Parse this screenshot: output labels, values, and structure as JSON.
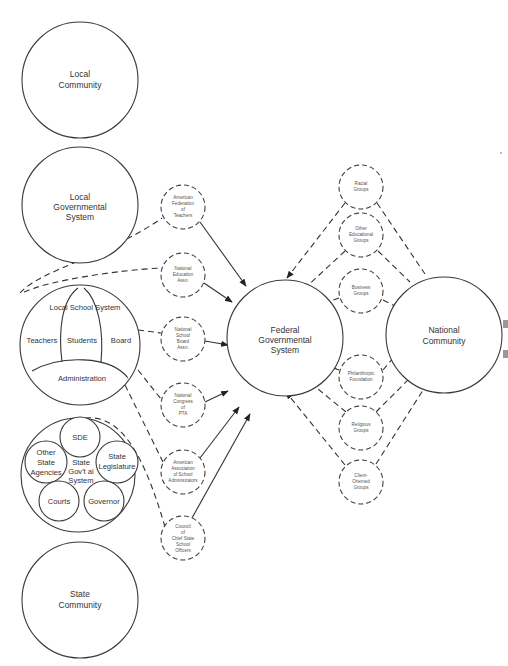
{
  "diagram": {
    "type": "system-relationship-diagram",
    "left_column": {
      "local_community": {
        "lines": [
          "Local",
          "Community"
        ]
      },
      "local_governmental_system": {
        "lines": [
          "Local",
          "Governmental",
          "System"
        ]
      },
      "local_school_system": {
        "title": "Local School System",
        "parts": [
          "Teachers",
          "Students",
          "Board"
        ],
        "bottom": "Administration"
      },
      "state_governmental_system": {
        "center_lines": [
          "State",
          "Gov't al",
          "System"
        ],
        "sde": "SDE",
        "other_state_agencies": [
          "Other",
          "State",
          "Agencies"
        ],
        "state_legislature": [
          "State",
          "Legislature"
        ],
        "courts": "Courts",
        "governor": "Governor"
      },
      "state_community": {
        "lines": [
          "State",
          "Community"
        ]
      }
    },
    "left_groups": [
      {
        "id": "aft",
        "lines": [
          "American",
          "Federation",
          "of",
          "Teachers"
        ]
      },
      {
        "id": "nea",
        "lines": [
          "National",
          "Education",
          "Assn."
        ]
      },
      {
        "id": "nsba",
        "lines": [
          "National",
          "School",
          "Board",
          "Assn."
        ]
      },
      {
        "id": "ncpta",
        "lines": [
          "National",
          "Congress",
          "of",
          "PTA"
        ]
      },
      {
        "id": "aasa",
        "lines": [
          "American",
          "Association",
          "of School",
          "Administrators"
        ]
      },
      {
        "id": "ccsso",
        "lines": [
          "Council",
          "of",
          "Chief State",
          "School",
          "Officers"
        ]
      }
    ],
    "federal": {
      "lines": [
        "Federal",
        "Governmental",
        "System"
      ]
    },
    "right_groups": [
      {
        "id": "racial",
        "lines": [
          "Racial",
          "Groups"
        ]
      },
      {
        "id": "other-educational",
        "lines": [
          "Other",
          "Educational",
          "Groups"
        ]
      },
      {
        "id": "business",
        "lines": [
          "Business",
          "Groups"
        ]
      },
      {
        "id": "philanthropic",
        "lines": [
          "Philanthropic",
          "Foundation"
        ]
      },
      {
        "id": "religious",
        "lines": [
          "Religious",
          "Groups"
        ]
      },
      {
        "id": "client-oriented",
        "lines": [
          "Client-",
          "Oriented",
          "Groups"
        ]
      }
    ],
    "national_community": {
      "lines": [
        "National",
        "Community"
      ]
    }
  }
}
